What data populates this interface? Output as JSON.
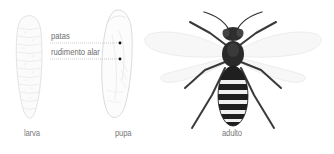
{
  "diagram": {
    "stages": [
      {
        "id": "larva",
        "label": "larva"
      },
      {
        "id": "pupa",
        "label": "pupa"
      },
      {
        "id": "adult",
        "label": "adulto"
      }
    ],
    "callouts": [
      {
        "label": "patas"
      },
      {
        "label": "rudimento alar"
      }
    ],
    "colors": {
      "label_text": "#7a7a7a",
      "outline": "#cfcfcf",
      "insect_dark": "#2b2b2b",
      "stripe_light": "#f2f2f2",
      "wing": "#e6e6e6"
    }
  }
}
